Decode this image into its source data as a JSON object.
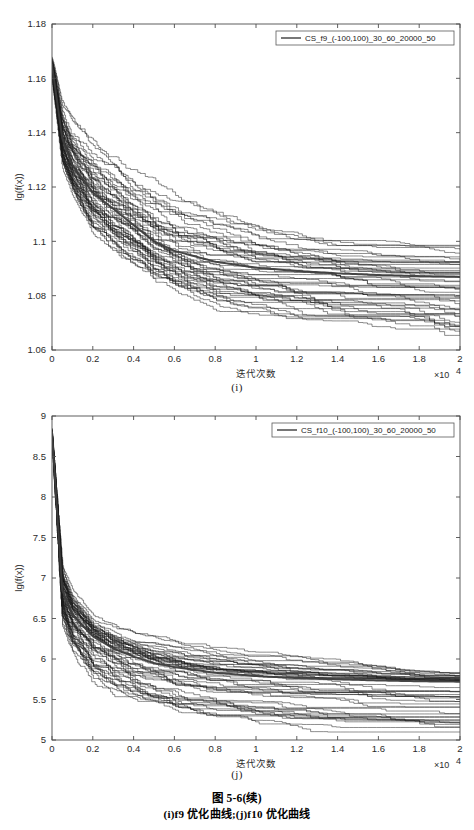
{
  "document": {
    "caption_title": "图 5-6(续)",
    "caption_sub": "(i)f9 优化曲线;(j)f10 优化曲线"
  },
  "figures": [
    {
      "id": "i",
      "sublabel": "(i)",
      "legend": "CS_f9_(-100,100)_30_60_20000_50",
      "xlabel": "迭代次数",
      "ylabel": "lg(f(x))",
      "x_exponent": "×10",
      "x_exponent_sup": "4",
      "xticks": [
        "0",
        "0.2",
        "0.4",
        "0.6",
        "0.8",
        "1",
        "1.2",
        "1.4",
        "1.6",
        "1.8",
        "2"
      ],
      "yticks": [
        "1.06",
        "1.08",
        "1.1",
        "1.12",
        "1.14",
        "1.16",
        "1.18"
      ]
    },
    {
      "id": "j",
      "sublabel": "(j)",
      "legend": "CS_f10_(-100,100)_30_60_20000_50",
      "xlabel": "迭代次数",
      "ylabel": "lg(f(x))",
      "x_exponent": "×10",
      "x_exponent_sup": "4",
      "xticks": [
        "0",
        "0.2",
        "0.4",
        "0.6",
        "0.8",
        "1",
        "1.2",
        "1.4",
        "1.6",
        "1.8",
        "2"
      ],
      "yticks": [
        "5",
        "5.5",
        "6",
        "6.5",
        "7",
        "7.5",
        "8",
        "8.5",
        "9"
      ]
    }
  ],
  "chart_data": [
    {
      "type": "line",
      "title": "",
      "subfigure": "(i)",
      "xlabel": "迭代次数",
      "ylabel": "lg(f(x))",
      "x_scale_factor": 10000,
      "xlim": [
        0,
        2
      ],
      "ylim": [
        1.06,
        1.18
      ],
      "xticks": [
        0,
        0.2,
        0.4,
        0.6,
        0.8,
        1.0,
        1.2,
        1.4,
        1.6,
        1.8,
        2.0
      ],
      "yticks": [
        1.06,
        1.08,
        1.1,
        1.12,
        1.14,
        1.16,
        1.18
      ],
      "grid": false,
      "legend_position": "top-right",
      "legend": [
        "CS_f9_(-100,100)_30_60_20000_50"
      ],
      "n_runs": 50,
      "x": [
        0,
        0.05,
        0.1,
        0.2,
        0.3,
        0.4,
        0.5,
        0.6,
        0.8,
        1.0,
        1.2,
        1.4,
        1.6,
        1.8,
        2.0
      ],
      "series": [
        {
          "name": "mean",
          "values": [
            1.165,
            1.138,
            1.128,
            1.118,
            1.112,
            1.106,
            1.1,
            1.0965,
            1.0925,
            1.0903,
            1.0891,
            1.0882,
            1.0876,
            1.0872,
            1.0869
          ]
        },
        {
          "name": "upper_envelope",
          "values": [
            1.168,
            1.152,
            1.145,
            1.136,
            1.13,
            1.125,
            1.121,
            1.118,
            1.112,
            1.107,
            1.104,
            1.102,
            1.101,
            1.1005,
            1.1
          ]
        },
        {
          "name": "lower_envelope",
          "values": [
            1.16,
            1.128,
            1.118,
            1.104,
            1.097,
            1.092,
            1.086,
            1.082,
            1.076,
            1.0735,
            1.0715,
            1.07,
            1.0685,
            1.067,
            1.0635
          ]
        }
      ]
    },
    {
      "type": "line",
      "title": "",
      "subfigure": "(j)",
      "xlabel": "迭代次数",
      "ylabel": "lg(f(x))",
      "x_scale_factor": 10000,
      "xlim": [
        0,
        2
      ],
      "ylim": [
        5,
        9
      ],
      "xticks": [
        0,
        0.2,
        0.4,
        0.6,
        0.8,
        1.0,
        1.2,
        1.4,
        1.6,
        1.8,
        2.0
      ],
      "yticks": [
        5,
        5.5,
        6,
        6.5,
        7,
        7.5,
        8,
        8.5,
        9
      ],
      "grid": false,
      "legend_position": "top-right",
      "legend": [
        "CS_f10_(-100,100)_30_60_20000_50"
      ],
      "n_runs": 50,
      "x": [
        0,
        0.05,
        0.1,
        0.2,
        0.3,
        0.4,
        0.5,
        0.6,
        0.8,
        1.0,
        1.2,
        1.4,
        1.6,
        1.8,
        2.0
      ],
      "series": [
        {
          "name": "mean",
          "values": [
            8.8,
            6.85,
            6.55,
            6.28,
            6.13,
            6.03,
            5.95,
            5.9,
            5.83,
            5.79,
            5.765,
            5.75,
            5.735,
            5.725,
            5.72
          ]
        },
        {
          "name": "upper_envelope",
          "values": [
            8.85,
            7.2,
            6.85,
            6.52,
            6.4,
            6.32,
            6.26,
            6.22,
            6.15,
            6.1,
            6.05,
            6.0,
            5.93,
            5.87,
            5.85
          ]
        },
        {
          "name": "lower_envelope",
          "values": [
            8.7,
            6.45,
            6.1,
            5.72,
            5.56,
            5.48,
            5.4,
            5.32,
            5.25,
            5.2,
            5.17,
            5.15,
            5.13,
            5.12,
            5.12
          ]
        }
      ]
    }
  ]
}
